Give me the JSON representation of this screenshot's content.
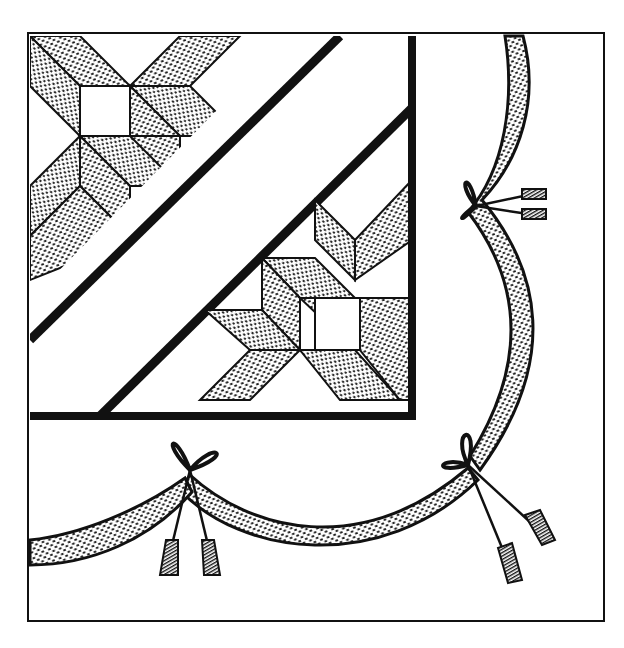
{
  "illustration": {
    "subject": "Quilt corner with star blocks and ribbon swag border",
    "visible_text": [],
    "colors": {
      "ink": "#111111",
      "paper": "#ffffff"
    },
    "elements": {
      "outer_border": "thin square frame",
      "inner_quilt": "heavy-bordered square with two diagonal sashing strips",
      "star_blocks": 2,
      "ribbon_bows": 3,
      "tassels": 6
    }
  }
}
